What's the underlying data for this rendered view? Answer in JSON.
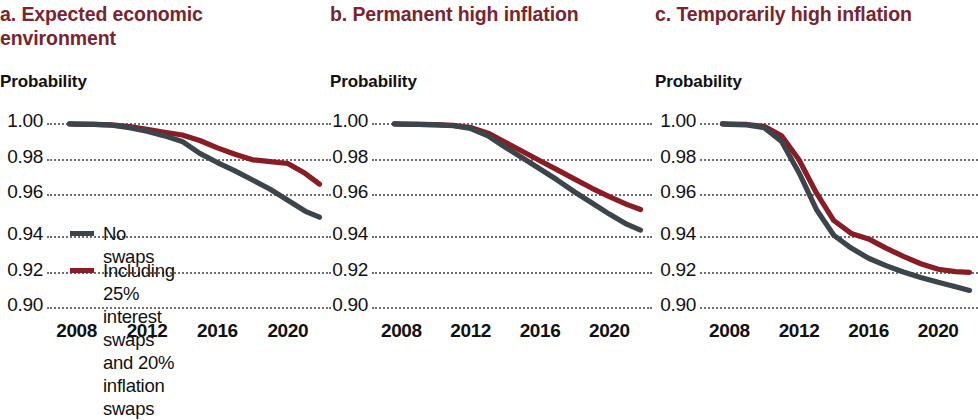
{
  "figure": {
    "background": "#ffffff",
    "panel_count": 3
  },
  "colors": {
    "title": "#7B2430",
    "no_swaps_line": "#3c444c",
    "with_swaps_line": "#8a1c24",
    "gridline": "#6e6e6e",
    "text": "#111111"
  },
  "legend": {
    "entries": [
      {
        "label": "No swaps",
        "color": "#3c444c"
      },
      {
        "label": "Including 25% interest swaps\nand 20% inflation swaps",
        "color": "#8a1c24"
      }
    ]
  },
  "chart_data": [
    {
      "type": "line",
      "panel_id": "a",
      "title": "a. Expected economic\nenvironment",
      "ylabel": "Probability",
      "xlabel": "",
      "xlim": [
        2007,
        2022
      ],
      "ylim": [
        0.9,
        1.0
      ],
      "grid": true,
      "grid_axis": "y",
      "legend_position": "inside-lower-left",
      "yticks": [
        "1.00",
        "0.98",
        "0.96",
        "0.94",
        "0.92",
        "0.90"
      ],
      "ytick_values": [
        1.0,
        0.98,
        0.96,
        0.94,
        0.92,
        0.9
      ],
      "xticks": [
        "2008",
        "2012",
        "2016",
        "2020"
      ],
      "xtick_values": [
        2008,
        2012,
        2016,
        2020
      ],
      "x": [
        2007.6,
        2008,
        2009,
        2010,
        2011,
        2012,
        2013,
        2014,
        2015,
        2016,
        2017,
        2018,
        2019,
        2020,
        2021,
        2021.8
      ],
      "series": [
        {
          "name": "No swaps",
          "color": "#3c444c",
          "values": [
            0.9995,
            0.9994,
            0.9992,
            0.9988,
            0.9975,
            0.9955,
            0.993,
            0.99,
            0.9835,
            0.9785,
            0.974,
            0.969,
            0.964,
            0.958,
            0.952,
            0.9488
          ]
        },
        {
          "name": "Including 25% interest swaps and 20% inflation swaps",
          "color": "#8a1c24",
          "values": [
            0.9995,
            0.9994,
            0.9993,
            0.999,
            0.998,
            0.9965,
            0.995,
            0.9935,
            0.9905,
            0.9865,
            0.983,
            0.98,
            0.979,
            0.978,
            0.9725,
            0.9668
          ]
        }
      ]
    },
    {
      "type": "line",
      "panel_id": "b",
      "title": "b. Permanent high inflation",
      "ylabel": "Probability",
      "xlabel": "",
      "xlim": [
        2007,
        2022
      ],
      "ylim": [
        0.9,
        1.0
      ],
      "grid": true,
      "grid_axis": "y",
      "legend_position": "none",
      "yticks": [
        "1.00",
        "0.98",
        "0.96",
        "0.94",
        "0.92",
        "0.90"
      ],
      "ytick_values": [
        1.0,
        0.98,
        0.96,
        0.94,
        0.92,
        0.9
      ],
      "xticks": [
        "2008",
        "2012",
        "2016",
        "2020"
      ],
      "xtick_values": [
        2008,
        2012,
        2016,
        2020
      ],
      "x": [
        2007.6,
        2008,
        2009,
        2010,
        2011,
        2012,
        2013,
        2014,
        2015,
        2016,
        2017,
        2018,
        2019,
        2020,
        2021,
        2021.8
      ],
      "series": [
        {
          "name": "No swaps",
          "color": "#3c444c",
          "values": [
            0.9995,
            0.9994,
            0.9992,
            0.999,
            0.9985,
            0.997,
            0.993,
            0.9868,
            0.981,
            0.975,
            0.969,
            0.9625,
            0.9565,
            0.9505,
            0.945,
            0.9418
          ]
        },
        {
          "name": "Including 25% interest swaps and 20% inflation swaps",
          "color": "#8a1c24",
          "values": [
            0.9995,
            0.9994,
            0.9993,
            0.9991,
            0.9987,
            0.9975,
            0.9945,
            0.9895,
            0.9845,
            0.9795,
            0.9745,
            0.9695,
            0.9645,
            0.96,
            0.9558,
            0.953
          ]
        }
      ]
    },
    {
      "type": "line",
      "panel_id": "c",
      "title": "c. Temporarily high inflation",
      "ylabel": "Probability",
      "xlabel": "",
      "xlim": [
        2007,
        2022
      ],
      "ylim": [
        0.9,
        1.0
      ],
      "grid": true,
      "grid_axis": "y",
      "legend_position": "none",
      "yticks": [
        "1.00",
        "0.98",
        "0.96",
        "0.94",
        "0.92",
        "0.90"
      ],
      "ytick_values": [
        1.0,
        0.98,
        0.96,
        0.94,
        0.92,
        0.9
      ],
      "xticks": [
        "2008",
        "2012",
        "2016",
        "2020"
      ],
      "xtick_values": [
        2008,
        2012,
        2016,
        2020
      ],
      "x": [
        2007.6,
        2008,
        2009,
        2010,
        2011,
        2012,
        2013,
        2014,
        2015,
        2016,
        2017,
        2018,
        2019,
        2020,
        2021,
        2021.8
      ],
      "series": [
        {
          "name": "No swaps",
          "color": "#3c444c",
          "values": [
            0.9995,
            0.9993,
            0.999,
            0.9975,
            0.99,
            0.973,
            0.953,
            0.939,
            0.932,
            0.9265,
            0.9225,
            0.919,
            0.916,
            0.9135,
            0.911,
            0.909
          ]
        },
        {
          "name": "Including 25% interest swaps and 20% inflation swaps",
          "color": "#8a1c24",
          "values": [
            0.9995,
            0.9994,
            0.9992,
            0.9982,
            0.993,
            0.98,
            0.962,
            0.947,
            0.94,
            0.937,
            0.932,
            0.9275,
            0.9235,
            0.9205,
            0.9192,
            0.9188
          ]
        }
      ]
    }
  ]
}
